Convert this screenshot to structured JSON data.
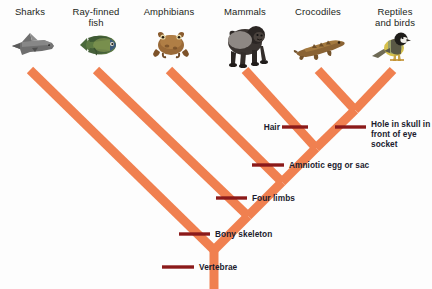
{
  "diagram": {
    "type": "phylogenetic-tree",
    "branch_color": "#F08050",
    "tick_color": "#8B1A1A",
    "label_color": "#231f20",
    "trait_label_color": "#1b1b2e",
    "background": "#fdfdfd"
  },
  "taxa": [
    {
      "id": "sharks",
      "label": "Sharks",
      "icon": "shark-icon",
      "x": 30,
      "y": 6,
      "tip_x": 30
    },
    {
      "id": "ray-finned-fish",
      "label": "Ray-finned\nfish",
      "icon": "fish-icon",
      "x": 96,
      "y": 6,
      "tip_x": 96
    },
    {
      "id": "amphibians",
      "label": "Amphibians",
      "icon": "frog-icon",
      "x": 169,
      "y": 6,
      "tip_x": 169
    },
    {
      "id": "mammals",
      "label": "Mammals",
      "icon": "gorilla-icon",
      "x": 245,
      "y": 6,
      "tip_x": 245
    },
    {
      "id": "crocodiles",
      "label": "Crocodiles",
      "icon": "crocodile-icon",
      "x": 318,
      "y": 6,
      "tip_x": 318
    },
    {
      "id": "reptiles-birds",
      "label": "Reptiles\nand birds",
      "icon": "bird-icon",
      "x": 393,
      "y": 6,
      "tip_x": 393
    }
  ],
  "traits": [
    {
      "id": "hair",
      "label": "Hair",
      "x": 258,
      "y": 122,
      "align": "right",
      "tick_x1": 282,
      "tick_x2": 308,
      "tick_y": 127
    },
    {
      "id": "hole-in-skull",
      "label": "Hole in skull in\nfront of eye socket",
      "x": 372,
      "y": 119,
      "align": "left",
      "tick_x1": 335,
      "tick_x2": 366,
      "tick_y": 127
    },
    {
      "id": "amniotic-egg",
      "label": "Amniotic egg or sac",
      "x": 290,
      "y": 160,
      "align": "left",
      "tick_x1": 252,
      "tick_x2": 284,
      "tick_y": 165
    },
    {
      "id": "four-limbs",
      "label": "Four limbs",
      "x": 253,
      "y": 193,
      "align": "left",
      "tick_x1": 216,
      "tick_x2": 247,
      "tick_y": 198
    },
    {
      "id": "bony-skeleton",
      "label": "Bony skeleton",
      "x": 216,
      "y": 229,
      "align": "left",
      "tick_x1": 179,
      "tick_x2": 210,
      "tick_y": 234
    },
    {
      "id": "vertebrae",
      "label": "Vertebrae",
      "x": 200,
      "y": 262,
      "align": "left",
      "tick_x1": 162,
      "tick_x2": 194,
      "tick_y": 267
    }
  ],
  "branches": [
    {
      "id": "trunk-root",
      "from": [
        214,
        289
      ],
      "to": [
        214,
        250
      ]
    },
    {
      "id": "branch-sharks",
      "from": [
        214,
        250
      ],
      "to": [
        30,
        70
      ]
    },
    {
      "id": "branch-to-bony-node",
      "from": [
        214,
        250
      ],
      "to": [
        248,
        216
      ]
    },
    {
      "id": "branch-ray-finned-fish",
      "from": [
        248,
        216
      ],
      "to": [
        96,
        70
      ]
    },
    {
      "id": "branch-to-limbs-node",
      "from": [
        248,
        216
      ],
      "to": [
        282,
        182
      ]
    },
    {
      "id": "branch-amphibians",
      "from": [
        282,
        182
      ],
      "to": [
        169,
        70
      ]
    },
    {
      "id": "branch-to-amnion-node",
      "from": [
        282,
        182
      ],
      "to": [
        316,
        148
      ]
    },
    {
      "id": "branch-mammals",
      "from": [
        316,
        148
      ],
      "to": [
        245,
        70
      ]
    },
    {
      "id": "branch-to-skull-node",
      "from": [
        316,
        148
      ],
      "to": [
        355,
        110
      ]
    },
    {
      "id": "branch-crocodiles",
      "from": [
        355,
        110
      ],
      "to": [
        318,
        70
      ]
    },
    {
      "id": "branch-reptiles-birds",
      "from": [
        355,
        110
      ],
      "to": [
        393,
        70
      ]
    }
  ]
}
